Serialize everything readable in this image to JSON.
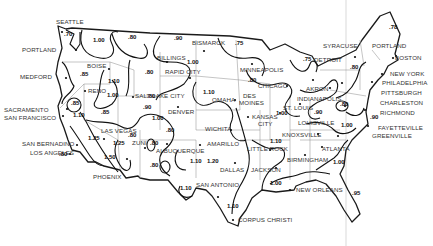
{
  "map": {
    "description": "Contour map of the contiguous United States with regional factor values",
    "cities": [
      {
        "name": "SEATTLE",
        "x": 56,
        "y": 24,
        "dot": [
          62,
          32
        ]
      },
      {
        "name": "PORTLAND",
        "x": 22,
        "y": 52,
        "dot": [
          76,
          50
        ]
      },
      {
        "name": "MEDFORD",
        "x": 20,
        "y": 79,
        "dot": [
          66,
          78
        ]
      },
      {
        "name": "BOISE",
        "x": 87,
        "y": 68,
        "dot": [
          109,
          69
        ]
      },
      {
        "name": "RENO",
        "x": 88,
        "y": 93,
        "dot": [
          85,
          91
        ]
      },
      {
        "name": "SACRAMENTO",
        "x": 4,
        "y": 112,
        "dot": [
          67,
          109
        ]
      },
      {
        "name": "SAN FRANCISCO",
        "x": 4,
        "y": 120,
        "dot": [
          63,
          116
        ]
      },
      {
        "name": "SALT LAKE CITY",
        "x": 135,
        "y": 98,
        "dot": [
          133,
          97
        ]
      },
      {
        "name": "LAS VEGAS",
        "x": 101,
        "y": 133,
        "dot": [
          104,
          139
        ]
      },
      {
        "name": "SAN BERNADINO",
        "x": 22,
        "y": 146,
        "dot": [
          77,
          145
        ]
      },
      {
        "name": "LOS ANGELES",
        "x": 30,
        "y": 155,
        "dot": [
          70,
          154
        ]
      },
      {
        "name": "PHOENIX",
        "x": 93,
        "y": 179,
        "dot": [
          127,
          159
        ]
      },
      {
        "name": "ZUNI",
        "x": 132,
        "y": 145,
        "dot": [
          145,
          148
        ]
      },
      {
        "name": "BILLINGS",
        "x": 157,
        "y": 60,
        "dot": [
          167,
          62
        ]
      },
      {
        "name": "RAPID CITY",
        "x": 165,
        "y": 74,
        "dot": [
          190,
          78
        ]
      },
      {
        "name": "BISMARCK",
        "x": 192,
        "y": 45,
        "dot": [
          204,
          51
        ]
      },
      {
        "name": "DENVER",
        "x": 168,
        "y": 114,
        "dot": [
          178,
          107
        ]
      },
      {
        "name": "ALBUQUERQUE",
        "x": 156,
        "y": 153,
        "dot": [
          167,
          144
        ]
      },
      {
        "name": "AMARILLO",
        "x": 207,
        "y": 146,
        "dot": [
          200,
          145
        ]
      },
      {
        "name": "WICHITA",
        "x": 205,
        "y": 131,
        "dot": [
          231,
          130
        ]
      },
      {
        "name": "OMAHA",
        "x": 212,
        "y": 102,
        "dot": [
          235,
          100
        ]
      },
      {
        "name": "DES",
        "x": 243,
        "y": 98,
        "dot": null
      },
      {
        "name": "MOINES",
        "x": 239,
        "y": 105,
        "dot": null
      },
      {
        "name": "KANSAS",
        "x": 252,
        "y": 119,
        "dot": [
          248,
          117
        ]
      },
      {
        "name": "CITY",
        "x": 258,
        "y": 126,
        "dot": null
      },
      {
        "name": "MINNEAPOLIS",
        "x": 240,
        "y": 72,
        "dot": [
          252,
          64
        ]
      },
      {
        "name": "CHICAGO",
        "x": 258,
        "y": 88,
        "dot": [
          287,
          86
        ]
      },
      {
        "name": "DALLAS",
        "x": 220,
        "y": 172,
        "dot": [
          235,
          163
        ]
      },
      {
        "name": "LITTLE ROCK",
        "x": 247,
        "y": 151,
        "dot": [
          270,
          150
        ]
      },
      {
        "name": "JACKSON",
        "x": 251,
        "y": 172,
        "dot": [
          276,
          168
        ]
      },
      {
        "name": "SAN ANTONIO",
        "x": 196,
        "y": 187,
        "dot": [
          218,
          197
        ]
      },
      {
        "name": "CORPUS CHRISTI",
        "x": 238,
        "y": 222,
        "dot": [
          233,
          220
        ]
      },
      {
        "name": "NEW ORLEANS",
        "x": 296,
        "y": 192,
        "dot": [
          290,
          190
        ]
      },
      {
        "name": "BIRMINGHAM",
        "x": 287,
        "y": 162,
        "dot": [
          305,
          155
        ]
      },
      {
        "name": "ATLANTA",
        "x": 322,
        "y": 151,
        "dot": [
          322,
          147
        ]
      },
      {
        "name": "KNOXSVILLE",
        "x": 282,
        "y": 137,
        "dot": [
          318,
          134
        ]
      },
      {
        "name": "LOUISVILLE",
        "x": 298,
        "y": 125,
        "dot": null
      },
      {
        "name": "ST. LOUIS",
        "x": 283,
        "y": 110,
        "dot": [
          280,
          113
        ]
      },
      {
        "name": "INDIANAPOLIS",
        "x": 297,
        "y": 101,
        "dot": [
          300,
          104
        ]
      },
      {
        "name": "AKRON",
        "x": 306,
        "y": 91,
        "dot": [
          330,
          88
        ]
      },
      {
        "name": "DETROIT",
        "x": 314,
        "y": 62,
        "dot": [
          313,
          80
        ]
      },
      {
        "name": "SYRACUSE",
        "x": 323,
        "y": 48,
        "dot": [
          355,
          57
        ]
      },
      {
        "name": "PORTLAND",
        "x": 372,
        "y": 48,
        "dot": [
          396,
          56
        ]
      },
      {
        "name": "BOSTON",
        "x": 395,
        "y": 60,
        "dot": [
          393,
          58
        ]
      },
      {
        "name": "NEW YORK",
        "x": 390,
        "y": 76,
        "dot": [
          382,
          74
        ]
      },
      {
        "name": "PHILADELPHIA",
        "x": 382,
        "y": 85,
        "dot": [
          372,
          82
        ]
      },
      {
        "name": "PITTSBURGH",
        "x": 381,
        "y": 95,
        "dot": [
          342,
          83
        ]
      },
      {
        "name": "CHARLESTON",
        "x": 380,
        "y": 105,
        "dot": [
          345,
          106
        ]
      },
      {
        "name": "RICHMOND",
        "x": 380,
        "y": 115,
        "dot": [
          365,
          110
        ]
      },
      {
        "name": "FAYETTEVILLE",
        "x": 378,
        "y": 130,
        "dot": [
          368,
          126
        ]
      },
      {
        "name": "GREENVILLE",
        "x": 372,
        "y": 138,
        "dot": [
          338,
          136
        ]
      }
    ],
    "values": [
      {
        "v": ".70",
        "x": 64,
        "y": 36
      },
      {
        "v": "1.00",
        "x": 93,
        "y": 42
      },
      {
        "v": ".80",
        "x": 128,
        "y": 39
      },
      {
        "v": ".90",
        "x": 174,
        "y": 40
      },
      {
        "v": ".75",
        "x": 235,
        "y": 45
      },
      {
        "v": "1.00",
        "x": 187,
        "y": 64
      },
      {
        "v": ".85",
        "x": 80,
        "y": 76
      },
      {
        "v": "1.10",
        "x": 108,
        "y": 83
      },
      {
        "v": ".80",
        "x": 145,
        "y": 74
      },
      {
        "v": ".85",
        "x": 71,
        "y": 105
      },
      {
        "v": "1.00",
        "x": 107,
        "y": 97
      },
      {
        "v": ".80",
        "x": 147,
        "y": 98
      },
      {
        "v": "1.10",
        "x": 73,
        "y": 117
      },
      {
        "v": ".85",
        "x": 101,
        "y": 114
      },
      {
        "v": ".90",
        "x": 143,
        "y": 109
      },
      {
        "v": "1.00",
        "x": 152,
        "y": 120
      },
      {
        "v": "1.10",
        "x": 203,
        "y": 94
      },
      {
        "v": ".80",
        "x": 248,
        "y": 82
      },
      {
        "v": "1.25",
        "x": 88,
        "y": 140
      },
      {
        "v": ".80",
        "x": 59,
        "y": 156
      },
      {
        "v": "1.25",
        "x": 113,
        "y": 145
      },
      {
        "v": "1.50",
        "x": 104,
        "y": 159
      },
      {
        "v": ".80",
        "x": 128,
        "y": 137
      },
      {
        "v": ".80",
        "x": 166,
        "y": 132
      },
      {
        "v": ".80",
        "x": 150,
        "y": 145
      },
      {
        "v": ".80",
        "x": 150,
        "y": 167
      },
      {
        "v": "1.10",
        "x": 190,
        "y": 163
      },
      {
        "v": "1.20",
        "x": 207,
        "y": 163
      },
      {
        "v": "1.10",
        "x": 180,
        "y": 190
      },
      {
        "v": "1.10",
        "x": 227,
        "y": 208
      },
      {
        "v": "1.00",
        "x": 270,
        "y": 185
      },
      {
        "v": "1.10",
        "x": 270,
        "y": 143
      },
      {
        "v": "1.00",
        "x": 276,
        "y": 115
      },
      {
        "v": ".75",
        "x": 303,
        "y": 61
      },
      {
        "v": ".80",
        "x": 350,
        "y": 69
      },
      {
        "v": ".78",
        "x": 389,
        "y": 29
      },
      {
        "v": ".90",
        "x": 314,
        "y": 114
      },
      {
        "v": ".80",
        "x": 340,
        "y": 106
      },
      {
        "v": ".90",
        "x": 370,
        "y": 119
      },
      {
        "v": "1.00",
        "x": 341,
        "y": 127
      },
      {
        "v": "1.00",
        "x": 333,
        "y": 164
      },
      {
        "v": ".95",
        "x": 352,
        "y": 195
      }
    ]
  }
}
